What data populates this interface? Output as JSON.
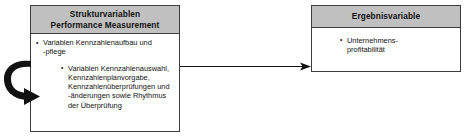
{
  "diagram": {
    "type": "block-diagram",
    "title_language": "de",
    "colors": {
      "header_fill": "#c0c0c0",
      "box_border": "#3d3d3d",
      "box_fill": "#ffffff",
      "text": "#111111",
      "arrow": "#111111"
    },
    "nodes": [
      {
        "id": "strukturvariablen",
        "header_lines": [
          "Strukturvariablen",
          "Performance Measurement"
        ],
        "bullets": [
          {
            "indented": false,
            "lines": [
              "Variablen Kennzahlenaufbau und",
              "-pflege"
            ]
          },
          {
            "indented": true,
            "lines": [
              "Variablen Kennzahlenauswahl,",
              "Kennzahlenplanvorgabe,",
              "Kennzahlenüberprüfungen und",
              "-änderungen sowie Rhythmus",
              "der Überprüfung"
            ]
          }
        ]
      },
      {
        "id": "ergebnisvariable",
        "header_lines": [
          "Ergebnisvariable"
        ],
        "bullets": [
          {
            "indented": false,
            "lines": [
              "Unternehmens-",
              "profitabilität"
            ]
          }
        ]
      }
    ],
    "connectors": [
      {
        "id": "struktur-to-ergebnis",
        "shape": "straight-arrow",
        "direction": "right",
        "from": "strukturvariablen",
        "to": "ergebnisvariable"
      },
      {
        "id": "feedback-loop",
        "shape": "curved-arrow",
        "direction": "clockwise",
        "to": "strukturvariablen"
      }
    ]
  }
}
